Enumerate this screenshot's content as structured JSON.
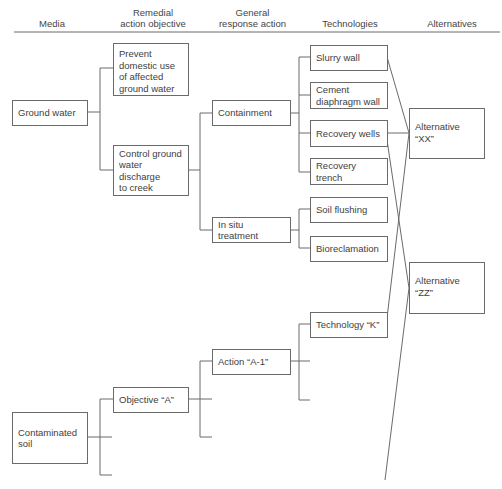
{
  "headers": {
    "media": "Media",
    "objective": "Remedial\naction objective",
    "response": "General\nresponse action",
    "technologies": "Technologies",
    "alternatives": "Alternatives"
  },
  "media": {
    "ground_water": "Ground water",
    "contaminated_soil": "Contaminated\nsoil"
  },
  "objectives": {
    "prevent": "Prevent\ndomestic use\nof affected\nground water",
    "control": "Control ground\nwater discharge\nto creek",
    "objective_a": "Objective “A”"
  },
  "responses": {
    "containment": "Containment",
    "in_situ": "In situ\ntreatment",
    "action_a1": "Action “A-1”"
  },
  "technologies": {
    "slurry_wall": "Slurry wall",
    "cement_wall": "Cement\ndiaphragm wall",
    "recovery_wells": "Recovery wells",
    "recovery_trench": "Recovery\ntrench",
    "soil_flushing": "Soil flushing",
    "bioreclamation": "Bioreclamation",
    "technology_k": "Technology “K”"
  },
  "alternatives": {
    "xx": "Alternative\n“XX”",
    "zz": "Alternative\n“ZZ”"
  },
  "colors": {
    "line": "#6a6a6a",
    "text": "#3e3e3e"
  }
}
